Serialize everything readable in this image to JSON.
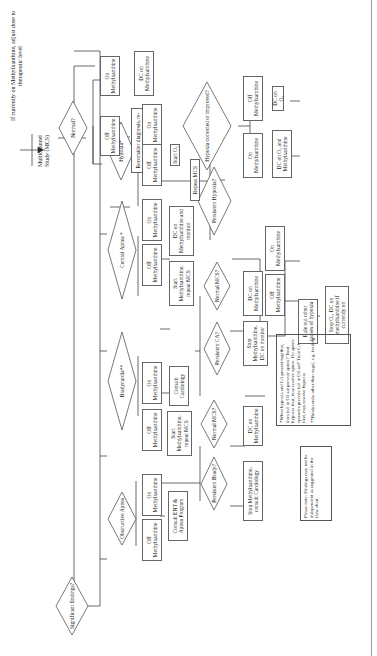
{
  "header": {
    "instruction": "If currently on Methylxanthine, adjust dose to therapeutic level",
    "start": "Multichannel Study (MCS)"
  },
  "decisions": {
    "normal": "Normal?",
    "significant": "Significant findings?",
    "hypoxia": "Hypoxia*",
    "central_apnea": "Central Apnea *",
    "bradycardia": "Bradycardia**",
    "obstructive": "Obstructive Apnea",
    "hypoxia_corrected": "Hypoxia corrected or improved?",
    "persistent_hypoxia": "Persistent Hypoxia?",
    "normal_mcs_1": "Normal MCS?",
    "persistent_ca": "Persistent CA?",
    "normal_mcs_2": "Normal MCS?",
    "persistent_brady": "Persistent Brady?"
  },
  "boxes": {
    "normal_on": "On Methylxanthine",
    "normal_off": "Off Methylxanthine",
    "normal_on_action": "DC on Methylxanthine",
    "normal_off_action": "Reconsider diagnosis, re-evaluate, consult Apnea Program",
    "hyp_on": "On Methylxanthine",
    "hyp_off": "Off Methylxanthine",
    "start_o2": "Start O₂",
    "repeat_mcs": "Repeat MCS",
    "hc_on": "On Methylxanthine",
    "hc_off": "Off Methylxanthine",
    "hc_on_action": "DC on O₂ and Methylxanthine",
    "hc_off_action": "DC on O₂",
    "ca_on": "On Methylxanthine",
    "ca_off": "Off Methylxanthine",
    "ca_on_action": "DC on Methylxanthine and monitor",
    "ca_off_action": "Start Methylxanthine, repeat MCS",
    "dc_on_meth_1": "DC on Methylxanthine",
    "ph_on": "On Methylxanthine",
    "ph_off": "Off Methylxanthine",
    "rule_out": "Rule out other causes of hypoxia",
    "stop_o2": "Stop O₂, DC on methylxanthine if currently on",
    "stop_meth_monitor": "Stop Methylxanthine, DC on monitor",
    "br_on": "On Methylxanthine",
    "br_off": "Off Methylxanthine",
    "consult_cardiology": "Consult Cardiology",
    "br_off_action": "Start Methylxanthine, repeat MCS",
    "dc_on_meth_2": "DC on Methylxanthine",
    "stop_meth_cardio": "Stop Methylxanthine, consult Cardiology",
    "ob_on": "On Methylxanthine",
    "ob_off": "Off Methylxanthine",
    "consult_ent": "Consult ENT & Apnea Program"
  },
  "notes": {
    "footnote_1": "*When hypoxia and CA present together, does fall in O2 sat precede apnea? Treat hypoxia first, may resolve apnea. Do apneic episodes precede fall in O2 sat? Treat CA first, may resolve hypoxia",
    "footnote_2": "**Bradycardia other than vagal, e.g. feeding",
    "please_note": "Please note: Findings may not be independent as suggested in the flow chart."
  }
}
